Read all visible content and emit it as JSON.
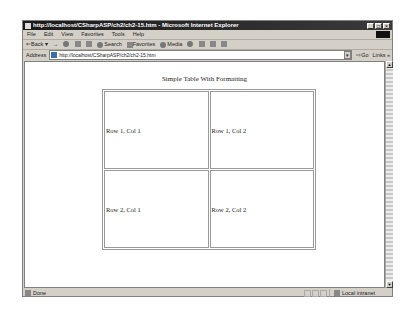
{
  "window": {
    "title": "http://localhost/CSharpASP/ch2/ch2-15.htm - Microsoft Internet Explorer",
    "controls": [
      "minimize",
      "maximize",
      "close"
    ]
  },
  "menu": [
    "File",
    "Edit",
    "View",
    "Favorites",
    "Tools",
    "Help"
  ],
  "toolbar": {
    "back": "Back",
    "forward": "→",
    "search": "Search",
    "favorites": "Favorites",
    "media": "Media"
  },
  "address": {
    "label": "Address",
    "url": "http://localhost/CSharpASP/ch2/ch2-15.htm",
    "go": "Go",
    "links": "Links"
  },
  "page": {
    "caption": "Simple Table With Formatting",
    "rows": [
      [
        "Row 1, Col 1",
        "Row 1, Col 2"
      ],
      [
        "Row 2, Col 1",
        "Row 2, Col 2"
      ]
    ]
  },
  "status": {
    "text": "Done",
    "zone": "Local intranet"
  }
}
